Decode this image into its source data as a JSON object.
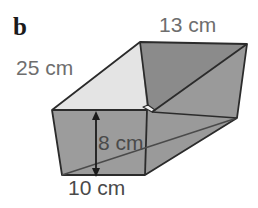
{
  "figure": {
    "part_label": "b",
    "shape": "open rectangular prism",
    "measurements": [
      {
        "name": "slant-length",
        "text": "25 cm",
        "value": 25,
        "unit": "cm"
      },
      {
        "name": "top-width",
        "text": "13 cm",
        "value": 13,
        "unit": "cm"
      },
      {
        "name": "height",
        "text": "8 cm",
        "value": 8,
        "unit": "cm"
      },
      {
        "name": "base-width",
        "text": "10 cm",
        "value": 10,
        "unit": "cm"
      }
    ],
    "colors": {
      "background": "#ffffff",
      "face_front": "#9c9c9c",
      "face_right": "#9a9a9a",
      "face_inner_light": "#e4e4e4",
      "face_inner_dark": "#8b8b8b",
      "face_top_band": "#a2a2a2",
      "outline": "#2b2b2b",
      "label_text": "#6e6e6e",
      "dimension_text": "#4a4a4a",
      "part_letter": "#1b1b1b"
    },
    "annotations": {
      "height_arrow": "double-headed vertical arrow"
    }
  }
}
